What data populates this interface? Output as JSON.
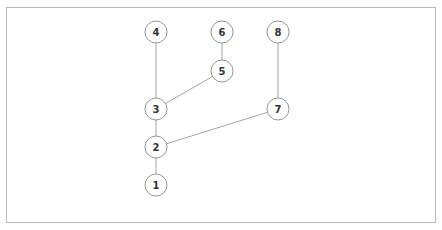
{
  "diagram": {
    "type": "tree",
    "nodes": [
      {
        "id": "1",
        "label": "1",
        "x": 156,
        "y": 185
      },
      {
        "id": "2",
        "label": "2",
        "x": 156,
        "y": 147
      },
      {
        "id": "3",
        "label": "3",
        "x": 156,
        "y": 109
      },
      {
        "id": "4",
        "label": "4",
        "x": 156,
        "y": 32
      },
      {
        "id": "5",
        "label": "5",
        "x": 222,
        "y": 71
      },
      {
        "id": "6",
        "label": "6",
        "x": 222,
        "y": 32
      },
      {
        "id": "7",
        "label": "7",
        "x": 278,
        "y": 109
      },
      {
        "id": "8",
        "label": "8",
        "x": 278,
        "y": 32
      }
    ],
    "edges": [
      {
        "from": "1",
        "to": "2"
      },
      {
        "from": "2",
        "to": "3"
      },
      {
        "from": "2",
        "to": "7"
      },
      {
        "from": "3",
        "to": "4"
      },
      {
        "from": "3",
        "to": "5"
      },
      {
        "from": "5",
        "to": "6"
      },
      {
        "from": "7",
        "to": "8"
      }
    ],
    "node_radius": 11
  }
}
